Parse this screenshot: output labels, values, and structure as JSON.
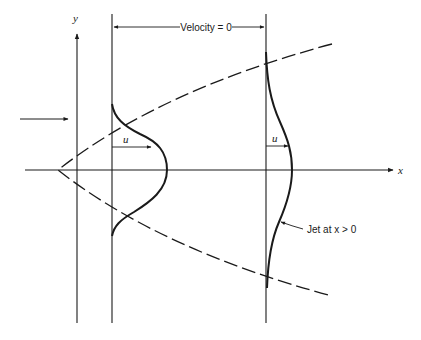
{
  "diagram": {
    "labels": {
      "velocity_zero": "Velocity = 0",
      "x_axis": "x",
      "y_axis": "y",
      "u_profile_1": "u",
      "u_profile_2": "u",
      "jet_annotation": "Jet at x > 0"
    },
    "colors": {
      "ink": "#1a1a1a",
      "background": "#ffffff"
    },
    "elements": [
      {
        "id": "y-axis",
        "type": "axis-arrow"
      },
      {
        "id": "x-axis",
        "type": "axis-arrow"
      },
      {
        "id": "inlet-arrow",
        "type": "arrow"
      },
      {
        "id": "jet-boundary",
        "type": "dashed-parabola"
      },
      {
        "id": "velocity-profile-near",
        "type": "bell-curve"
      },
      {
        "id": "velocity-profile-far",
        "type": "bell-curve"
      },
      {
        "id": "velocity-zero-dimension",
        "type": "double-arrow"
      }
    ]
  }
}
